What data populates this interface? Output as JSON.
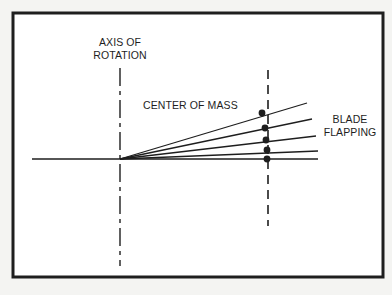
{
  "labels": {
    "axis_of_rotation": [
      "AXIS OF",
      "ROTATION"
    ],
    "center_of_mass": "CENTER OF MASS",
    "blade_flapping": [
      "BLADE",
      "FLAPPING"
    ]
  },
  "colors": {
    "background": "#f4f4f2",
    "frame_fill": "#ffffff",
    "ink": "#1e1e1e"
  },
  "geometry": {
    "frame": {
      "x": 13,
      "y": 13,
      "width": 370,
      "height": 264,
      "stroke_width": 3
    },
    "hub": {
      "x": 120,
      "y": 159
    },
    "horizontal_line": {
      "x1": 32,
      "x2": 318,
      "y": 159
    },
    "axis_of_rotation_line": {
      "x": 120,
      "y1": 68,
      "y2": 266,
      "style": "dash-dot"
    },
    "center_of_mass_line": {
      "x": 268,
      "y1": 70,
      "y2": 226,
      "style": "dashed"
    },
    "blades": [
      {
        "x2": 307,
        "y2": 103,
        "dot": {
          "x": 262,
          "y": 113
        }
      },
      {
        "x2": 312,
        "y2": 119,
        "dot": {
          "x": 265,
          "y": 128
        }
      },
      {
        "x2": 316,
        "y2": 136,
        "dot": {
          "x": 266,
          "y": 140
        }
      },
      {
        "x2": 318,
        "y2": 151,
        "dot": {
          "x": 267,
          "y": 150
        }
      },
      {
        "x2": 318,
        "y2": 159,
        "dot": {
          "x": 267,
          "y": 159
        }
      }
    ]
  }
}
